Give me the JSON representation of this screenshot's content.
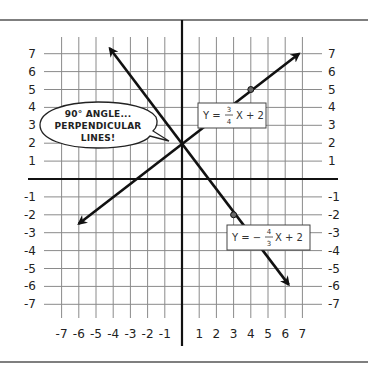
{
  "chart_data": {
    "type": "line",
    "title": "",
    "xlabel": "",
    "ylabel": "",
    "xlim": [
      -7,
      7
    ],
    "ylim": [
      -7,
      7
    ],
    "grid": true,
    "x_ticks": [
      "-7",
      "-6",
      "-5",
      "-4",
      "-3",
      "-2",
      "-1",
      "1",
      "2",
      "3",
      "4",
      "5",
      "6",
      "7"
    ],
    "y_ticks_left": [
      "7",
      "6",
      "5",
      "4",
      "3",
      "2",
      "1",
      "-1",
      "-2",
      "-3",
      "-4",
      "-5",
      "-6",
      "-7"
    ],
    "y_ticks_right": [
      "7",
      "6",
      "5",
      "4",
      "3",
      "2",
      "1",
      "-1",
      "-2",
      "-3",
      "-4",
      "-5",
      "-6",
      "-7"
    ],
    "series": [
      {
        "name": "Y = 3/4 X + 2",
        "slope": 0.75,
        "intercept": 2,
        "from": [
          -6,
          -2.5
        ],
        "to": [
          6.8,
          7
        ],
        "arrows": "both",
        "marked_points": [
          [
            0,
            2
          ],
          [
            4,
            5
          ]
        ]
      },
      {
        "name": "Y = -4/3 X + 2",
        "slope": -1.3333,
        "intercept": 2,
        "from": [
          -4.2,
          7.3
        ],
        "to": [
          6.2,
          -5.9
        ],
        "arrows": "both",
        "marked_points": [
          [
            0,
            2
          ],
          [
            3,
            -2
          ]
        ]
      }
    ],
    "annotations": [
      {
        "type": "speech-bubble",
        "text": "90° ANGLE... PERPENDICULAR LINES!",
        "points_to": [
          0,
          2
        ]
      },
      {
        "type": "equation-label",
        "text": "Y = 3/4 X + 2",
        "near": [
          3,
          3.5
        ]
      },
      {
        "type": "equation-label",
        "text": "Y = -4/3 X + 2",
        "near": [
          5,
          -3.5
        ]
      }
    ]
  },
  "bubble": {
    "line1": "90° ANGLE...",
    "line2": "PERPENDICULAR",
    "line3": "LINES!"
  },
  "equations": {
    "eq1": {
      "prefix": "Y =",
      "num": "3",
      "den": "4",
      "suffix": "X + 2"
    },
    "eq2": {
      "prefix": "Y = −",
      "num": "4",
      "den": "3",
      "suffix": "X + 2"
    }
  },
  "colors": {
    "grid": "#8a8a8a",
    "axis": "#111111",
    "line": "#111111",
    "frame": "#555555",
    "point_fill": "#666666"
  }
}
